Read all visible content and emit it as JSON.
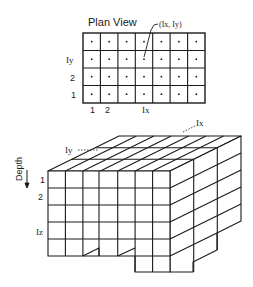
{
  "plan_view": {
    "title": "Plan View",
    "cols": 7,
    "rows": 4,
    "callout": "(Ix, Iy)",
    "row_labels": [
      "Iy",
      "2",
      "1"
    ],
    "col_labels": [
      "1",
      "2",
      "Ix"
    ]
  },
  "block_view": {
    "label_iy": "Iy",
    "label_ix": "Ix",
    "depth_label": "Depth",
    "depth_labels": [
      "1",
      "2",
      "Iz"
    ]
  },
  "colors": {
    "line": "#1a1a1a",
    "background": "#ffffff"
  }
}
